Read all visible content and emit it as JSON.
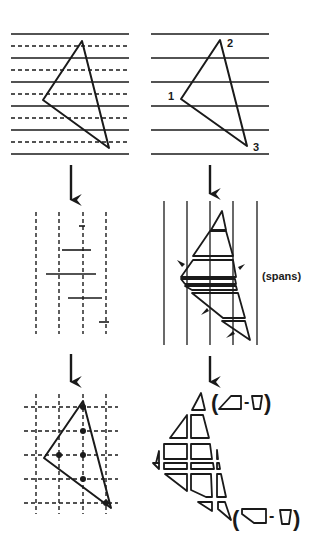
{
  "figure": {
    "ink_color": "#1a1a1a",
    "background": "#ffffff"
  },
  "panels": {
    "top_left": {
      "name": "scanlines-with-triangle",
      "solid_lines_y": [
        34,
        58,
        82,
        106,
        130,
        154
      ],
      "dashed_lines_y": [
        46,
        70,
        94,
        118,
        142
      ]
    },
    "top_right": {
      "name": "numbered-triangle",
      "vertex_labels": [
        {
          "id": "v1",
          "text": "1"
        },
        {
          "id": "v2",
          "text": "2"
        },
        {
          "id": "v3",
          "text": "3"
        }
      ]
    },
    "middle_left": {
      "name": "sample-spans"
    },
    "middle_right": {
      "name": "span-slabs",
      "label": "(spans)"
    },
    "bottom_left": {
      "name": "pixel-sample-grid"
    },
    "bottom_right": {
      "name": "pixel-fragments",
      "formula_top": {
        "open": "(",
        "minus": "-",
        "close": ")"
      },
      "formula_bottom": {
        "open": "(",
        "minus": "-",
        "close": ")"
      }
    }
  }
}
